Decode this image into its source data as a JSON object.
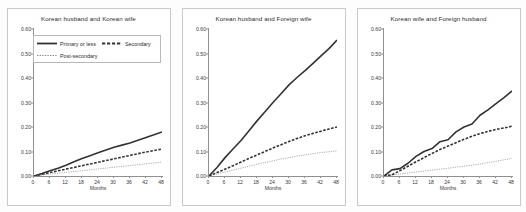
{
  "figure": {
    "background": "#fdfdfd",
    "xlabel": "Months",
    "ylim": [
      0,
      0.6
    ],
    "xlim": [
      0,
      48
    ],
    "yticks": [
      "0.00",
      "0.10",
      "0.20",
      "0.30",
      "0.40",
      "0.50",
      "0.60"
    ],
    "ytick_values": [
      0.0,
      0.1,
      0.2,
      0.3,
      0.4,
      0.5,
      0.6
    ],
    "xticks": [
      "0",
      "6",
      "12",
      "18",
      "24",
      "30",
      "36",
      "42",
      "48"
    ],
    "xtick_values": [
      0,
      6,
      12,
      18,
      24,
      30,
      36,
      42,
      48
    ]
  },
  "legend": {
    "position": "upper-left-panel-1",
    "entries": [
      {
        "label": "Primary or less",
        "style": "solid-thick",
        "color": "#333333",
        "icon": "line-solid-icon"
      },
      {
        "label": "Secondary",
        "style": "dashed-thick",
        "color": "#333333",
        "icon": "line-dashed-icon"
      },
      {
        "label": "Post-secondary",
        "style": "dotted-thin",
        "color": "#8a8a8a",
        "icon": "line-dotted-icon"
      }
    ]
  },
  "chart_data": {
    "type": "line",
    "xlabel": "Months",
    "ylabel": "",
    "xlim": [
      0,
      48
    ],
    "ylim": [
      0,
      0.6
    ],
    "grid": false,
    "legend_position": "upper left (panel 1)",
    "x": [
      0,
      3,
      6,
      9,
      12,
      15,
      18,
      21,
      24,
      27,
      30,
      33,
      36,
      39,
      42,
      45,
      48
    ],
    "panels": [
      {
        "title": "Korean husband and Korean wife",
        "series": [
          {
            "name": "Primary or less",
            "style": "solid-thick",
            "color": "#333333",
            "values": [
              0.0,
              0.01,
              0.021,
              0.032,
              0.044,
              0.058,
              0.071,
              0.083,
              0.095,
              0.106,
              0.117,
              0.126,
              0.135,
              0.146,
              0.157,
              0.168,
              0.18
            ]
          },
          {
            "name": "Secondary",
            "style": "dashed-thick",
            "color": "#333333",
            "values": [
              0.0,
              0.007,
              0.014,
              0.021,
              0.028,
              0.035,
              0.042,
              0.049,
              0.056,
              0.063,
              0.07,
              0.077,
              0.084,
              0.091,
              0.098,
              0.104,
              0.11
            ]
          },
          {
            "name": "Post-secondary",
            "style": "dotted-thin",
            "color": "#8a8a8a",
            "values": [
              0.0,
              0.004,
              0.008,
              0.011,
              0.015,
              0.018,
              0.022,
              0.025,
              0.029,
              0.032,
              0.036,
              0.039,
              0.043,
              0.046,
              0.05,
              0.053,
              0.057
            ]
          }
        ]
      },
      {
        "title": "Korean husband and Foreign wife",
        "series": [
          {
            "name": "Primary or less",
            "style": "solid-thick",
            "color": "#333333",
            "values": [
              0.0,
              0.035,
              0.075,
              0.11,
              0.145,
              0.185,
              0.225,
              0.262,
              0.3,
              0.336,
              0.372,
              0.402,
              0.43,
              0.46,
              0.49,
              0.52,
              0.555
            ]
          },
          {
            "name": "Secondary",
            "style": "dashed-thick",
            "color": "#333333",
            "values": [
              0.0,
              0.014,
              0.028,
              0.042,
              0.057,
              0.072,
              0.086,
              0.1,
              0.114,
              0.128,
              0.141,
              0.153,
              0.164,
              0.174,
              0.183,
              0.192,
              0.2
            ]
          },
          {
            "name": "Post-secondary",
            "style": "dotted-thin",
            "color": "#8a8a8a",
            "values": [
              0.0,
              0.008,
              0.016,
              0.024,
              0.032,
              0.04,
              0.048,
              0.055,
              0.062,
              0.069,
              0.075,
              0.081,
              0.086,
              0.091,
              0.096,
              0.099,
              0.103
            ]
          }
        ]
      },
      {
        "title": "Korean wife and Foreign husband",
        "series": [
          {
            "name": "Primary or less",
            "style": "solid-thick",
            "color": "#333333",
            "values": [
              0.0,
              0.025,
              0.03,
              0.052,
              0.08,
              0.1,
              0.112,
              0.14,
              0.148,
              0.18,
              0.2,
              0.212,
              0.248,
              0.27,
              0.295,
              0.32,
              0.347
            ]
          },
          {
            "name": "Secondary",
            "style": "dashed-thick",
            "color": "#333333",
            "values": [
              0.0,
              0.005,
              0.022,
              0.04,
              0.058,
              0.075,
              0.092,
              0.108,
              0.122,
              0.136,
              0.15,
              0.162,
              0.173,
              0.182,
              0.19,
              0.196,
              0.203
            ]
          },
          {
            "name": "Post-secondary",
            "style": "dotted-thin",
            "color": "#8a8a8a",
            "values": [
              0.0,
              0.004,
              0.008,
              0.012,
              0.016,
              0.02,
              0.024,
              0.028,
              0.032,
              0.036,
              0.04,
              0.044,
              0.049,
              0.055,
              0.06,
              0.066,
              0.072
            ]
          }
        ]
      }
    ]
  }
}
